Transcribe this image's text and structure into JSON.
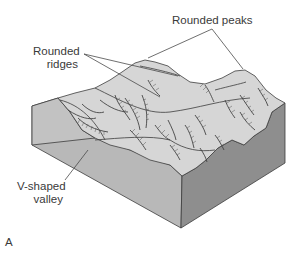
{
  "figure": {
    "panel_letter": "A",
    "labels": {
      "rounded_peaks": "Rounded peaks",
      "rounded_ridges_line1": "Rounded",
      "rounded_ridges_line2": "ridges",
      "v_valley_line1": "V-shaped",
      "v_valley_line2": "valley"
    },
    "colors": {
      "top_surface": "#d4d4d4",
      "left_face": "#bdbdbd",
      "front_face": "#b4b4b4",
      "right_face": "#8c8c8c",
      "outline": "#3c3c3c",
      "leader_line": "#4a4a4a"
    }
  }
}
